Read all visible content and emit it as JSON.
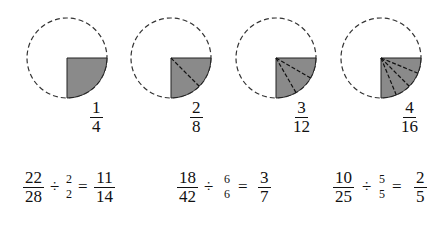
{
  "circles": [
    {
      "numerator": "1",
      "denominator": "4",
      "slices": 1
    },
    {
      "numerator": "2",
      "denominator": "8",
      "slices": 2
    },
    {
      "numerator": "3",
      "denominator": "12",
      "slices": 3
    },
    {
      "numerator": "4",
      "denominator": "16",
      "slices": 4
    }
  ],
  "equations": [
    {
      "a_num": "22",
      "a_den": "28",
      "op": "÷",
      "d_num": "2",
      "d_den": "2",
      "eq": "=",
      "r_num": "11",
      "r_den": "14"
    },
    {
      "a_num": "18",
      "a_den": "42",
      "op": "÷",
      "d_num": "6",
      "d_den": "6",
      "eq": "=",
      "r_num": "3",
      "r_den": "7"
    },
    {
      "a_num": "10",
      "a_den": "25",
      "op": "÷",
      "d_num": "5",
      "d_den": "5",
      "eq": "=",
      "r_num": "2",
      "r_den": "5"
    }
  ],
  "colors": {
    "shade": "#8a8a8a",
    "line": "#222222"
  }
}
